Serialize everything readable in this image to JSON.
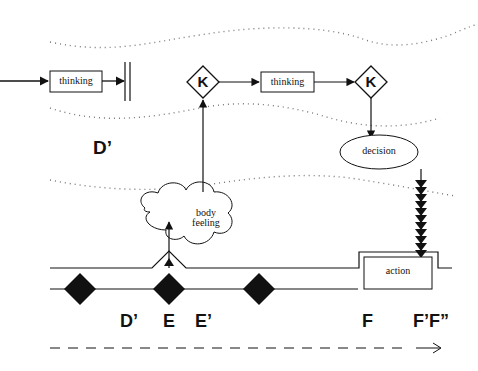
{
  "diagram": {
    "boxes": {
      "thinking_1": "thinking",
      "thinking_2": "thinking",
      "decision": "decision",
      "action": "action",
      "body_feeling_line1": "body",
      "body_feeling_line2": "feeling"
    },
    "k_nodes": {
      "k1": "K",
      "k2": "K"
    },
    "region_label": "D’",
    "timeline_labels": {
      "d_prime": "D’",
      "e": "E",
      "e_prime": "E’",
      "f": "F",
      "f_prime_f_double": "F’F”"
    },
    "colors": {
      "ink": "#111111",
      "dotted": "#777777",
      "background": "#ffffff"
    }
  }
}
